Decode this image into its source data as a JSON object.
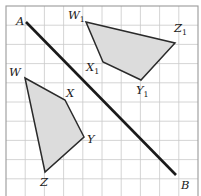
{
  "figure": {
    "canvas": {
      "width": 201,
      "height": 196
    },
    "colors": {
      "shape_fill": "#dcdcdc",
      "shape_stroke": "#2a2a2a",
      "mirror_line": "#1a1a1a",
      "grid_line": "#c9c9c9",
      "grid_border": "#9a9a9a",
      "label_text": "#1a1a1a",
      "background": "#ffffff"
    },
    "grid": {
      "x0": 6,
      "y0": 6,
      "cell": 19.2,
      "cols": 10,
      "rows": 10,
      "visible": true
    },
    "mirror_line": {
      "name": "AB",
      "from_label": "A",
      "to_label": "B",
      "from": {
        "x": 26,
        "y": 22
      },
      "to": {
        "x": 176,
        "y": 175
      }
    },
    "shapes": [
      {
        "name": "quadrilateral-wxyz",
        "id": "object",
        "filled": true,
        "points": [
          {
            "label": "W",
            "sub": "",
            "x": 25,
            "y": 78
          },
          {
            "label": "X",
            "sub": "",
            "x": 65,
            "y": 100
          },
          {
            "label": "Y",
            "sub": "",
            "x": 84,
            "y": 137
          },
          {
            "label": "Z",
            "sub": "",
            "x": 45,
            "y": 172
          }
        ]
      },
      {
        "name": "quadrilateral-w1x1y1z1",
        "id": "image",
        "filled": true,
        "points": [
          {
            "label": "W",
            "sub": "1",
            "x": 86,
            "y": 22
          },
          {
            "label": "Z",
            "sub": "1",
            "x": 175,
            "y": 43
          },
          {
            "label": "Y",
            "sub": "1",
            "x": 141,
            "y": 80
          },
          {
            "label": "X",
            "sub": "1",
            "x": 103,
            "y": 62
          }
        ]
      }
    ],
    "labels": [
      {
        "name": "vertex-label-A",
        "text": "A",
        "sub": "",
        "x": 16,
        "y": 25
      },
      {
        "name": "vertex-label-B",
        "text": "B",
        "sub": "",
        "x": 181,
        "y": 189
      },
      {
        "name": "vertex-label-W",
        "text": "W",
        "sub": "",
        "x": 9,
        "y": 76
      },
      {
        "name": "vertex-label-X",
        "text": "X",
        "sub": "",
        "x": 66,
        "y": 97
      },
      {
        "name": "vertex-label-Y",
        "text": "Y",
        "sub": "",
        "x": 87,
        "y": 143
      },
      {
        "name": "vertex-label-Z",
        "text": "Z",
        "sub": "",
        "x": 40,
        "y": 186
      },
      {
        "name": "vertex-label-W1",
        "text": "W",
        "sub": "1",
        "x": 68,
        "y": 19
      },
      {
        "name": "vertex-label-X1",
        "text": "X",
        "sub": "1",
        "x": 86,
        "y": 71
      },
      {
        "name": "vertex-label-Y1",
        "text": "Y",
        "sub": "1",
        "x": 136,
        "y": 94
      },
      {
        "name": "vertex-label-Z1",
        "text": "Z",
        "sub": "1",
        "x": 174,
        "y": 32
      }
    ]
  }
}
